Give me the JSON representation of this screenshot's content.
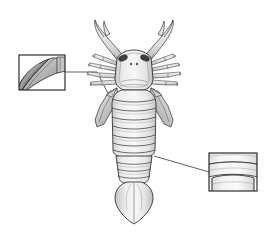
{
  "figure": {
    "background_color": "#ffffff",
    "width": 268,
    "height": 235
  },
  "style": {
    "outline_color": "#2b2b2b",
    "outline_color_soft": "#4a4a4a",
    "line_color": "#1a1a1a",
    "fill_light": "#f2f2f2",
    "fill_mid": "#e2e2e2",
    "fill_dark": "#c8c8c8",
    "fill_shadow": "#9a9a9a",
    "eye_color": "#3a3a3a",
    "inset_border_color": "#1a1a1a",
    "inset_fill": "#ffffff",
    "leader_line_color": "#1a1a1a"
  },
  "specimen": {
    "name": "sea-scorpion-dorsal-view",
    "parts": [
      {
        "id": "chelicera-left",
        "label": "Left chelicera",
        "interactable": false
      },
      {
        "id": "chelicera-right",
        "label": "Right chelicera",
        "interactable": false
      },
      {
        "id": "carapace",
        "label": "Carapace (head shield)",
        "interactable": false
      },
      {
        "id": "eye-left",
        "label": "Left compound eye",
        "interactable": false
      },
      {
        "id": "eye-right",
        "label": "Right compound eye",
        "interactable": false
      },
      {
        "id": "ocellus-left",
        "label": "Left median ocellus",
        "interactable": false
      },
      {
        "id": "ocellus-right",
        "label": "Right median ocellus",
        "interactable": false
      },
      {
        "id": "walking-legs-left",
        "label": "Left walking legs",
        "interactable": false
      },
      {
        "id": "walking-legs-right",
        "label": "Right walking legs",
        "interactable": false
      },
      {
        "id": "swimming-paddle-left",
        "label": "Left swimming paddle",
        "interactable": false
      },
      {
        "id": "swimming-paddle-right",
        "label": "Right swimming paddle",
        "interactable": false
      },
      {
        "id": "mesosoma",
        "label": "Mesosoma (preabdomen tergites)",
        "interactable": false
      },
      {
        "id": "metasoma",
        "label": "Metasoma (postabdomen tergites)",
        "interactable": false
      },
      {
        "id": "telson",
        "label": "Telson (tail plate)",
        "interactable": false
      }
    ],
    "tergite_count": 12
  },
  "insets": [
    {
      "id": "inset-paddle-detail",
      "position": "upper-left",
      "caption": "",
      "subject": "swimming-paddle-blade-detail",
      "target_part": "swimming-paddle-left",
      "box": {
        "x": 19,
        "y": 55,
        "width": 46,
        "height": 35
      },
      "leader_line": {
        "from_x": 65,
        "from_y": 72,
        "mid_x": 97,
        "mid_y": 72,
        "to_x": 113,
        "to_y": 103
      }
    },
    {
      "id": "inset-tergite-detail",
      "position": "lower-right",
      "caption": "",
      "subject": "tergite-ornament-detail",
      "target_part": "metasoma",
      "box": {
        "x": 209,
        "y": 153,
        "width": 48,
        "height": 38
      },
      "leader_line": {
        "from_x": 209,
        "from_y": 172,
        "mid_x": 209,
        "mid_y": 172,
        "to_x": 154,
        "to_y": 156
      }
    }
  ]
}
